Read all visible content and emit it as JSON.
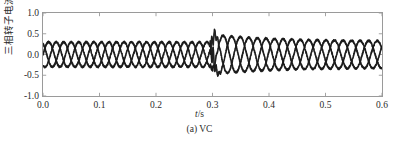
{
  "chart_data": {
    "type": "line",
    "title": "",
    "subtitle": "",
    "caption": "(a) VC",
    "xlabel_italic": "t",
    "xlabel_rest": "/s",
    "xlabel": "t/s",
    "ylabel": "三相转子电流/kA",
    "xlim": [
      0.0,
      0.6
    ],
    "ylim": [
      -1.0,
      1.0
    ],
    "xticks": [
      "0.0",
      "0.1",
      "0.2",
      "0.3",
      "0.4",
      "0.5",
      "0.6"
    ],
    "xtick_values": [
      0.0,
      0.1,
      0.2,
      0.3,
      0.4,
      0.5,
      0.6
    ],
    "yticks": [
      "1.0",
      "0.5",
      "0.0",
      "-0.5",
      "-1.0"
    ],
    "ytick_values": [
      1.0,
      0.5,
      0.0,
      -0.5,
      -1.0
    ],
    "grid": false,
    "legend": "none",
    "trace_color": "#1a1a1a",
    "frame_color": "#9a9a9a",
    "background": "#ffffff",
    "signal": {
      "description": "Three-phase rotor current, noisy sinusoids, fault transient at t = 0.3 s",
      "n_phases": 3,
      "phase_offsets_deg": [
        0,
        -120,
        -240
      ],
      "frequency_hz": 25.0,
      "post_fault_frequency_hz": 22.0,
      "noise_amplitude": 0.022,
      "fault_time_s": 0.3,
      "amplitude_before_fault": 0.3,
      "spike_peak_positive": 0.5,
      "spike_peak_negative": -0.62,
      "amplitude_peak_after_fault": 0.48,
      "amplitude_settled": 0.32,
      "recovery_time_constant_s": 0.11
    },
    "series": [
      {
        "name": "phase-a",
        "phase_deg": 0,
        "x": [
          0.0,
          0.05,
          0.1,
          0.15,
          0.2,
          0.25,
          0.3,
          0.32,
          0.35,
          0.4,
          0.45,
          0.5,
          0.55,
          0.6
        ],
        "y": [
          -0.12,
          0.3,
          -0.12,
          -0.12,
          0.3,
          -0.12,
          0.5,
          -0.62,
          0.46,
          -0.18,
          0.41,
          -0.16,
          0.34,
          0.16
        ]
      },
      {
        "name": "phase-b",
        "phase_deg": -120,
        "x": [
          0.0,
          0.05,
          0.1,
          0.15,
          0.2,
          0.25,
          0.3,
          0.32,
          0.35,
          0.4,
          0.45,
          0.5,
          0.55,
          0.6
        ],
        "y": [
          0.3,
          -0.12,
          -0.12,
          0.3,
          -0.12,
          -0.12,
          -0.55,
          0.46,
          0.1,
          0.44,
          -0.2,
          0.33,
          -0.14,
          -0.3
        ]
      },
      {
        "name": "phase-c",
        "phase_deg": -240,
        "x": [
          0.0,
          0.05,
          0.1,
          0.15,
          0.2,
          0.25,
          0.3,
          0.32,
          0.35,
          0.4,
          0.45,
          0.5,
          0.55,
          0.6
        ],
        "y": [
          -0.18,
          -0.18,
          0.3,
          -0.18,
          -0.18,
          0.3,
          0.05,
          0.16,
          -0.48,
          -0.26,
          -0.21,
          -0.17,
          -0.2,
          0.14
        ]
      }
    ]
  }
}
